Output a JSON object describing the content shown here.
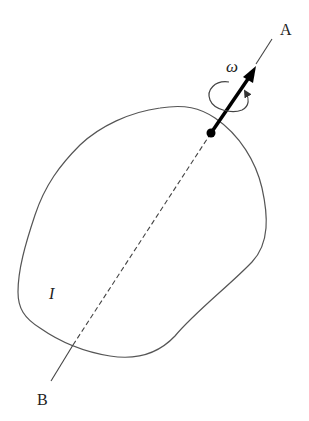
{
  "diagram": {
    "type": "rigid body rotating about axis",
    "labels": {
      "axis_top": "A",
      "axis_bottom": "B",
      "angular_velocity": "ω",
      "moment_of_inertia": "I"
    },
    "colors": {
      "stroke": "#555555",
      "arrow": "#000000",
      "background": "#ffffff"
    },
    "elements": [
      "irregular body outline",
      "rotation axis A–B (solid outside, dashed inside body)",
      "pivot point on body boundary",
      "angular velocity vector ω along axis",
      "curved rotation-sense arrow around axis"
    ]
  }
}
